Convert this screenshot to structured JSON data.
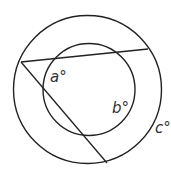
{
  "diagram": {
    "outer_circle": {
      "cx": 87.5,
      "cy": 89.5,
      "r": 74
    },
    "inner_circle": {
      "cx": 89,
      "cy": 89.5,
      "r": 46
    },
    "lines": [
      {
        "x1": 21,
        "y1": 62,
        "x2": 148,
        "y2": 49
      },
      {
        "x1": 21,
        "y1": 62,
        "x2": 107,
        "y2": 163
      }
    ],
    "labels": {
      "a": "a°",
      "b": "b°",
      "c": "c°"
    },
    "stroke_color": "#222222"
  }
}
